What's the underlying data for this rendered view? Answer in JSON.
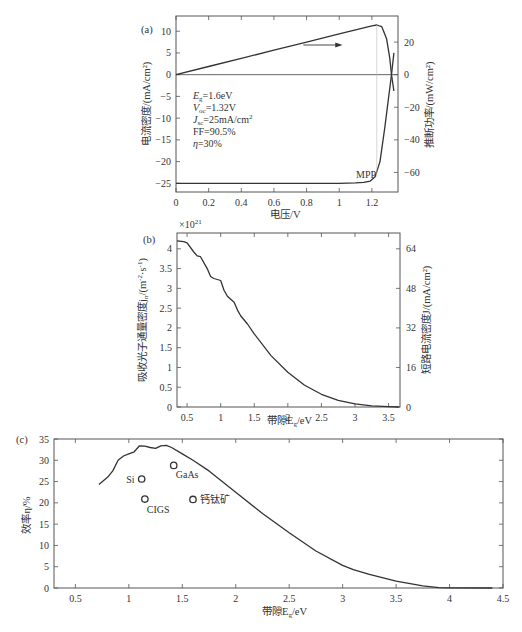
{
  "chart_data": [
    {
      "panel": "(a)",
      "type": "line",
      "xlabel": "电压/V",
      "ylabel_left": "电流密度/(mA/cm²)",
      "ylabel_right": "推断功率/(mW/cm²)",
      "xlim": [
        0,
        1.36
      ],
      "ylim_left": [
        -27,
        13.5
      ],
      "ylim_right": [
        -72,
        36
      ],
      "xticks": [
        0,
        0.2,
        0.4,
        0.6,
        0.8,
        1,
        1.2
      ],
      "yticks_left": [
        10,
        5,
        0,
        -5,
        -10,
        -15,
        -20,
        -25
      ],
      "yticks_right": [
        20,
        0,
        -20,
        -40,
        -60
      ],
      "annotations": [
        "E_g=1.6eV",
        "V_oc=1.32V",
        "J_sc=25mA/cm²",
        "FF=90.5%",
        "η=30%",
        "MPP"
      ],
      "series": [
        {
          "name": "J-V curve",
          "x": [
            0,
            0.4,
            0.8,
            1.0,
            1.1,
            1.15,
            1.19,
            1.22,
            1.25,
            1.28,
            1.3,
            1.32,
            1.335
          ],
          "y": [
            -25,
            -25,
            -25,
            -25,
            -24.9,
            -24.8,
            -24.5,
            -23.5,
            -20,
            -12,
            -6,
            0,
            5
          ]
        },
        {
          "name": "Power curve",
          "x": [
            0,
            0.2,
            0.4,
            0.6,
            0.8,
            1.0,
            1.2,
            1.23,
            1.26,
            1.29,
            1.31,
            1.32,
            1.335
          ],
          "y_right": [
            0,
            5,
            10,
            15,
            20,
            25,
            30,
            30.5,
            29.5,
            22,
            10,
            0,
            -10
          ]
        }
      ]
    },
    {
      "panel": "(b)",
      "type": "line",
      "xlabel": "带隙E_g/eV",
      "ylabel_left": "吸收光子通量密度j_n/(m⁻²·s⁻¹)",
      "ylabel_right": "短路电流密度J/(mA/cm²)",
      "y_multiplier": "×10²¹",
      "xlim": [
        0.35,
        3.67
      ],
      "ylim_left": [
        0,
        4.4
      ],
      "ylim_right": [
        0,
        70.4
      ],
      "xticks": [
        0.5,
        1,
        1.5,
        2,
        2.5,
        3,
        3.5
      ],
      "yticks_left": [
        0,
        0.5,
        1,
        1.5,
        2,
        2.5,
        3,
        3.5,
        4
      ],
      "yticks_right": [
        0,
        16,
        32,
        48,
        64
      ],
      "series": [
        {
          "name": "Absorbed photon flux",
          "x": [
            0.35,
            0.45,
            0.5,
            0.6,
            0.65,
            0.7,
            0.8,
            0.85,
            0.9,
            1.0,
            1.05,
            1.1,
            1.2,
            1.25,
            1.3,
            1.4,
            1.5,
            1.75,
            2.0,
            2.25,
            2.5,
            2.75,
            3.0,
            3.25,
            3.5,
            3.65
          ],
          "y": [
            4.2,
            4.18,
            4.15,
            3.92,
            3.82,
            3.8,
            3.5,
            3.3,
            3.25,
            3.2,
            2.95,
            2.8,
            2.65,
            2.45,
            2.3,
            2.1,
            1.85,
            1.3,
            0.88,
            0.55,
            0.32,
            0.17,
            0.08,
            0.03,
            0.01,
            0
          ]
        }
      ]
    },
    {
      "panel": "(c)",
      "type": "line",
      "xlabel": "带隙E_g/eV",
      "ylabel": "效率η/%",
      "xlim": [
        0.3,
        4.5
      ],
      "ylim": [
        0,
        35
      ],
      "xticks": [
        0.5,
        1,
        1.5,
        2,
        2.5,
        3,
        3.5,
        4,
        4.5
      ],
      "yticks": [
        0,
        5,
        10,
        15,
        20,
        25,
        30,
        35
      ],
      "series": [
        {
          "name": "SQ limit",
          "x": [
            0.72,
            0.8,
            0.85,
            0.9,
            0.95,
            1.0,
            1.05,
            1.1,
            1.15,
            1.2,
            1.25,
            1.3,
            1.35,
            1.4,
            1.5,
            1.6,
            1.75,
            2.0,
            2.25,
            2.5,
            2.75,
            3.0,
            3.1,
            3.25,
            3.5,
            3.75,
            3.9,
            4.0,
            4.4
          ],
          "y": [
            24.3,
            26,
            27.5,
            30,
            31,
            31.5,
            32,
            33.4,
            33.3,
            33,
            32.8,
            33.4,
            33.5,
            33,
            31.5,
            30,
            27.5,
            22.5,
            17.5,
            13,
            8.7,
            5.3,
            4.3,
            3.2,
            1.6,
            0.5,
            0.1,
            0.05,
            0
          ]
        }
      ],
      "points": [
        {
          "label": "Si",
          "x": 1.12,
          "y": 25.6
        },
        {
          "label": "GaAs",
          "x": 1.42,
          "y": 28.8
        },
        {
          "label": "CIGS",
          "x": 1.15,
          "y": 20.9
        },
        {
          "label": "钙钛矿",
          "x": 1.6,
          "y": 20.8
        }
      ]
    }
  ],
  "labels": {
    "a": {
      "panel": "(a)",
      "xlabel": "电压/V",
      "ylabel_left": "电流密度/(mA/cm²)",
      "ylabel_right": "推断功率/(mW/cm²)",
      "eg": "=1.6eV",
      "voc": "=1.32V",
      "jsc": "=25mA/cm",
      "ff": "FF=90.5%",
      "eta": "=30%",
      "mpp": "MPP"
    },
    "b": {
      "panel": "(b)",
      "mult": "×10",
      "mult_exp": "21",
      "xlabel": "带隙E",
      "ylabel_left": "吸收光子通量密度j",
      "ylabel_right": "短路电流密度J/(mA/cm²)"
    },
    "c": {
      "panel": "(c)",
      "xlabel": "带隙E",
      "ylabel": "效率η/%"
    }
  }
}
